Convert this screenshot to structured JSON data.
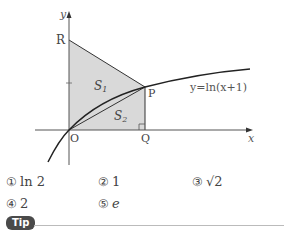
{
  "figure": {
    "axis_x_label": "x",
    "axis_y_label": "y",
    "points": {
      "R": "R",
      "P": "P",
      "O": "O",
      "Q": "Q"
    },
    "regions": {
      "S1": "S",
      "S1_sub": "1",
      "S2": "S",
      "S2_sub": "2"
    },
    "curve_label": "y=ln(x+1)",
    "colors": {
      "shade": "#d9d9d9",
      "line": "#222222"
    }
  },
  "options": [
    {
      "num": "①",
      "text": "ln 2"
    },
    {
      "num": "②",
      "text": "1"
    },
    {
      "num": "③",
      "text": "√2"
    },
    {
      "num": "④",
      "text": "2"
    },
    {
      "num": "⑤",
      "text": "e"
    }
  ],
  "tip": {
    "label": "Tip"
  }
}
